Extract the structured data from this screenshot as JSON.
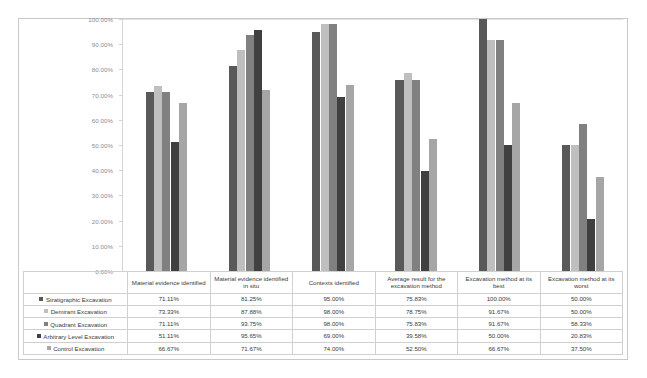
{
  "chart_data": {
    "type": "bar",
    "title": "",
    "subtitle": "",
    "xlabel": "",
    "ylabel": "",
    "ylim": [
      0,
      100
    ],
    "grid": false,
    "legend_position": "table-left",
    "y_ticks": [
      "0.00%",
      "10.00%",
      "20.00%",
      "30.00%",
      "40.00%",
      "50.00%",
      "60.00%",
      "70.00%",
      "80.00%",
      "90.00%",
      "100.00%"
    ],
    "categories": [
      "Material evidence identified",
      "Material evidence identified in situ",
      "Contexts identified",
      "Average result for the excavation method",
      "Excavation method at its best",
      "Excavation method at its worst"
    ],
    "series": [
      {
        "name": "Stratigraphic Excavation",
        "color": "#595959",
        "values": [
          71.11,
          81.25,
          95.0,
          75.83,
          100.0,
          50.0
        ],
        "labels": [
          "71.11%",
          "81.25%",
          "95.00%",
          "75.83%",
          "100.00%",
          "50.00%"
        ]
      },
      {
        "name": "Demirant Excavation",
        "color": "#bfbfbf",
        "values": [
          73.33,
          87.88,
          98.0,
          78.75,
          91.67,
          50.0
        ],
        "labels": [
          "73.33%",
          "87.88%",
          "98.00%",
          "78.75%",
          "91.67%",
          "50.00%"
        ]
      },
      {
        "name": "Quadrant Excavation",
        "color": "#808080",
        "values": [
          71.11,
          93.75,
          98.0,
          75.83,
          91.67,
          58.33
        ],
        "labels": [
          "71.11%",
          "93.75%",
          "98.00%",
          "75.83%",
          "91.67%",
          "58.33%"
        ]
      },
      {
        "name": "Arbitrary Level Excavation",
        "color": "#404040",
        "values": [
          51.11,
          95.65,
          69.0,
          39.58,
          50.0,
          20.83
        ],
        "labels": [
          "51.11%",
          "95.65%",
          "69.00%",
          "39.58%",
          "50.00%",
          "20.83%"
        ]
      },
      {
        "name": "Control Excavation",
        "color": "#a6a6a6",
        "values": [
          66.67,
          71.67,
          74.0,
          52.5,
          66.67,
          37.5
        ],
        "labels": [
          "66.67%",
          "71.67%",
          "74.00%",
          "52.50%",
          "66.67%",
          "37.50%"
        ]
      }
    ]
  },
  "colors": {
    "frame_border": "#c9c9c9",
    "axis_line": "#d4d4d4",
    "grid_line": "#e2e2e2",
    "tick_label": "#8a8a8a",
    "table_border": "#d0d0d0",
    "table_text": "#3a3a3a"
  }
}
